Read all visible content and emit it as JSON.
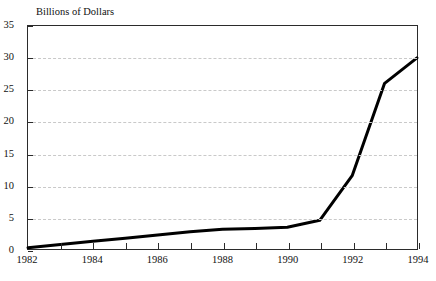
{
  "chart_data": {
    "type": "line",
    "title": "",
    "ylabel": "Billions of Dollars",
    "xlabel": "",
    "categories": [
      "1982",
      "1983",
      "1984",
      "1985",
      "1986",
      "1987",
      "1988",
      "1989",
      "1990",
      "1991",
      "1992",
      "1993",
      "1994"
    ],
    "x": [
      1982,
      1983,
      1984,
      1985,
      1986,
      1987,
      1988,
      1989,
      1990,
      1991,
      1992,
      1993,
      1994
    ],
    "values": [
      0.2,
      0.7,
      1.2,
      1.7,
      2.2,
      2.7,
      3.1,
      3.2,
      3.4,
      4.5,
      11.5,
      26.0,
      30.0
    ],
    "series": [
      {
        "name": "Billions of Dollars",
        "values": [
          0.2,
          0.7,
          1.2,
          1.7,
          2.2,
          2.7,
          3.1,
          3.2,
          3.4,
          4.5,
          11.5,
          26.0,
          30.0
        ]
      }
    ],
    "ylim": [
      0,
      35
    ],
    "xlim": [
      1982,
      1994
    ],
    "y_ticks": [
      0,
      5,
      10,
      15,
      20,
      25,
      30,
      35
    ],
    "y_tick_labels": [
      "0",
      "5",
      "10",
      "15",
      "20",
      "25",
      "30",
      "35"
    ],
    "x_ticks": [
      1982,
      1983,
      1984,
      1985,
      1986,
      1987,
      1988,
      1989,
      1990,
      1991,
      1992,
      1993,
      1994
    ],
    "x_tick_labels_shown": [
      "1982",
      "1984",
      "1986",
      "1988",
      "1990",
      "1992",
      "1994"
    ],
    "grid": "horizontal-dashed",
    "legend": "none",
    "line_color": "#000000",
    "grid_color": "#c9c9c9",
    "axis_color": "#2b2b2b"
  },
  "axis": {
    "y_title": "Billions of Dollars"
  },
  "caption": {
    "source_text": ""
  }
}
